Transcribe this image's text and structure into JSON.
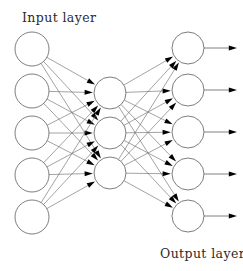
{
  "figure": {
    "kind": "neural-network-diagram",
    "background_color": "#ffffff",
    "node_stroke_color": "#6e6e6e",
    "node_fill_color": "#ffffff",
    "edge_color": "#6a6a6a",
    "arrow_color": "#000000",
    "text_color": "#2b2b2b"
  },
  "labels": {
    "input": "Input layer",
    "output": "Output layer"
  },
  "layers": [
    {
      "id": "input",
      "name": "Input layer",
      "node_count": 5,
      "cx": 32,
      "r": 17,
      "cy": [
        49,
        91,
        133,
        175,
        217
      ]
    },
    {
      "id": "hidden",
      "name": "Hidden layer",
      "node_count": 3,
      "cx": 110,
      "r": 16,
      "cy": [
        93,
        133,
        173
      ]
    },
    {
      "id": "output",
      "name": "Output layer",
      "node_count": 5,
      "cx": 188,
      "r": 16,
      "cy": [
        48,
        90,
        132,
        174,
        216
      ]
    }
  ],
  "connections": {
    "input_to_hidden": "fully-connected",
    "hidden_to_output": "fully-connected",
    "input_to_hidden_count": 15,
    "hidden_to_output_count": 15,
    "arrowheads": true
  },
  "output_arrows": {
    "count": 5,
    "start_x": 204,
    "end_x": 237,
    "cy": [
      48,
      90,
      132,
      174,
      216
    ]
  },
  "label_positions": {
    "input": {
      "x": 22,
      "y": 22
    },
    "output": {
      "x": 160,
      "y": 258
    }
  }
}
